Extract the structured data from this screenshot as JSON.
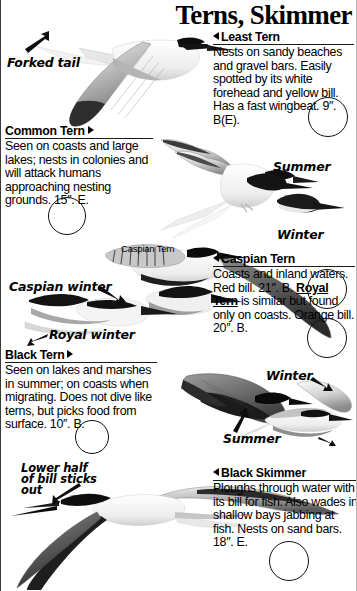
{
  "page": {
    "title": "Terns, Skimmer"
  },
  "entries": [
    {
      "id": "least-tern",
      "name": "Least Tern",
      "marker": "triangle-left",
      "body": "Nests on sandy beaches and gravel bars. Easily spotted by its white forehead and yellow bill. Has a fast wingbeat.",
      "size_code": "9″. B(E)."
    },
    {
      "id": "common-tern",
      "name": "Common Tern",
      "marker": "triangle-right",
      "body": "Seen on coasts and large lakes; nests in colonies and will attack humans approaching nesting grounds.",
      "size_code": "15″. E."
    },
    {
      "id": "caspian-tern",
      "name": "Caspian Tern",
      "marker": "triangle-left",
      "body": "Coasts and inland waters. Red bill.",
      "size_code": "21″. B.",
      "sub_name": "Royal Tern",
      "sub_body": " is similar but found only on coasts. Orange bill. 20″. B."
    },
    {
      "id": "black-tern",
      "name": "Black Tern",
      "marker": "triangle-right",
      "body": "Seen on lakes and marshes in summer; on coasts when migrating. Does not dive like terns, but picks food from surface.",
      "size_code": "10″. B."
    },
    {
      "id": "black-skimmer",
      "name": "Black Skimmer",
      "marker": "triangle-left",
      "body": "Ploughs through water with its bill for fish. Also wades in shallow bays jabbing at fish. Nests on sand bars.",
      "size_code": "18″. E."
    }
  ],
  "annotations": {
    "forked_tail": "Forked tail",
    "summer_tern_head": "Summer",
    "winter_tern_head": "Winter",
    "caspian_tern_label": "Caspian Tern",
    "caspian_winter": "Caspian winter",
    "royal_winter": "Royal winter",
    "black_tern_winter": "Winter",
    "black_tern_summer": "Summer",
    "skimmer_bill_line1": "Lower half",
    "skimmer_bill_line2": "of bill sticks",
    "skimmer_bill_line3": "out"
  },
  "checkboxes": [
    {
      "id": "check-least-tern"
    },
    {
      "id": "check-common-tern"
    },
    {
      "id": "check-caspian-tern"
    },
    {
      "id": "check-royal-tern"
    },
    {
      "id": "check-black-tern"
    },
    {
      "id": "check-black-skimmer"
    }
  ],
  "colors": {
    "ink": "#000000",
    "rule": "#1a1a1a",
    "paper": "#ffffff",
    "bird_dark": "#2b2b2b",
    "bird_mid": "#9a9a9a",
    "bird_light": "#d8d8d8"
  }
}
